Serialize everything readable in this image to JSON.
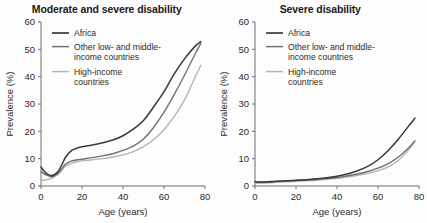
{
  "figure": {
    "background": "#fdfdfd",
    "series_colors": {
      "africa": "#3a3a3a",
      "other_lmic": "#6e6e6e",
      "high_income": "#b3b3b3"
    }
  },
  "legend": {
    "items": [
      {
        "label": "Africa",
        "key": "africa"
      },
      {
        "label": "Other low- and middle-",
        "label2": "income countries",
        "key": "other_lmic"
      },
      {
        "label": "High-income",
        "label2": "countries",
        "key": "high_income"
      }
    ]
  },
  "chart_data": [
    {
      "type": "line",
      "title": "Moderate and severe disability",
      "xlabel": "Age (years)",
      "ylabel": "Prevalence (%)",
      "xlim": [
        0,
        80
      ],
      "ylim": [
        0,
        60
      ],
      "xticks": [
        0,
        20,
        40,
        60,
        80
      ],
      "yticks": [
        0,
        10,
        20,
        30,
        40,
        50,
        60
      ],
      "grid": false,
      "legend_position": "top-left",
      "x": [
        0,
        2,
        5,
        8,
        10,
        12,
        15,
        18,
        20,
        25,
        30,
        35,
        40,
        45,
        50,
        55,
        60,
        65,
        70,
        75,
        78
      ],
      "series": [
        {
          "name": "Africa",
          "key": "africa",
          "color": "#3a3a3a",
          "values": [
            7.0,
            5.0,
            3.8,
            5.0,
            7.5,
            10.5,
            13.0,
            14.0,
            14.4,
            15.0,
            15.8,
            16.8,
            18.4,
            20.8,
            24.0,
            29.0,
            34.5,
            41.0,
            46.5,
            51.0,
            52.8
          ]
        },
        {
          "name": "Other low- and middle-income countries",
          "key": "other_lmic",
          "color": "#6e6e6e",
          "values": [
            5.2,
            4.2,
            3.4,
            4.4,
            6.2,
            8.0,
            9.2,
            9.6,
            9.8,
            10.4,
            11.0,
            11.8,
            13.0,
            14.6,
            17.2,
            21.5,
            27.0,
            33.5,
            40.5,
            48.0,
            52.2
          ]
        },
        {
          "name": "High-income countries",
          "key": "high_income",
          "color": "#b3b3b3",
          "values": [
            2.0,
            2.2,
            2.8,
            4.0,
            5.6,
            7.2,
            8.4,
            8.9,
            9.2,
            9.6,
            10.0,
            10.6,
            11.4,
            12.6,
            14.4,
            17.0,
            20.6,
            25.5,
            31.5,
            39.5,
            44.2
          ]
        }
      ]
    },
    {
      "type": "line",
      "title": "Severe disability",
      "xlabel": "Age (years)",
      "ylabel": "Prevalence (%)",
      "xlim": [
        0,
        80
      ],
      "ylim": [
        0,
        60
      ],
      "xticks": [
        0,
        20,
        40,
        60,
        80
      ],
      "yticks": [
        0,
        10,
        20,
        30,
        40,
        50,
        60
      ],
      "grid": false,
      "legend_position": "top-left",
      "x": [
        0,
        2,
        5,
        8,
        10,
        12,
        15,
        18,
        20,
        25,
        30,
        35,
        40,
        45,
        50,
        55,
        60,
        65,
        70,
        75,
        78
      ],
      "series": [
        {
          "name": "Africa",
          "key": "africa",
          "color": "#3a3a3a",
          "values": [
            1.6,
            1.5,
            1.5,
            1.6,
            1.7,
            1.8,
            1.9,
            2.0,
            2.1,
            2.3,
            2.6,
            3.0,
            3.6,
            4.4,
            5.6,
            7.2,
            9.6,
            13.0,
            17.2,
            22.0,
            24.8
          ]
        },
        {
          "name": "Other low- and middle-income countries",
          "key": "other_lmic",
          "color": "#6e6e6e",
          "values": [
            1.5,
            1.4,
            1.4,
            1.5,
            1.6,
            1.7,
            1.8,
            1.9,
            2.0,
            2.2,
            2.4,
            2.7,
            3.1,
            3.7,
            4.4,
            5.3,
            6.5,
            8.2,
            10.6,
            14.0,
            16.6
          ]
        },
        {
          "name": "High-income countries",
          "key": "high_income",
          "color": "#b3b3b3",
          "values": [
            1.0,
            1.0,
            1.1,
            1.2,
            1.3,
            1.4,
            1.5,
            1.6,
            1.7,
            1.9,
            2.1,
            2.4,
            2.8,
            3.3,
            3.9,
            4.6,
            5.6,
            7.0,
            9.4,
            13.2,
            16.2
          ]
        }
      ]
    }
  ]
}
